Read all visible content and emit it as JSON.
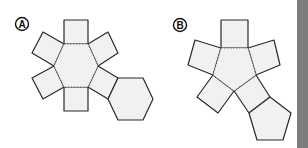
{
  "labels": {
    "a": "A",
    "b": "B"
  },
  "colors": {
    "face_fill": "#f1f1f1",
    "edge": "#2a2a2a",
    "side_bar": "#7d7d7d"
  },
  "nets": [
    {
      "id": "A",
      "description": "Net of a hexagonal prism: central hexagon, six squares, one extra hexagon"
    },
    {
      "id": "B",
      "description": "Net of a pentagonal prism: central pentagon, five squares, one extra pentagon"
    }
  ]
}
